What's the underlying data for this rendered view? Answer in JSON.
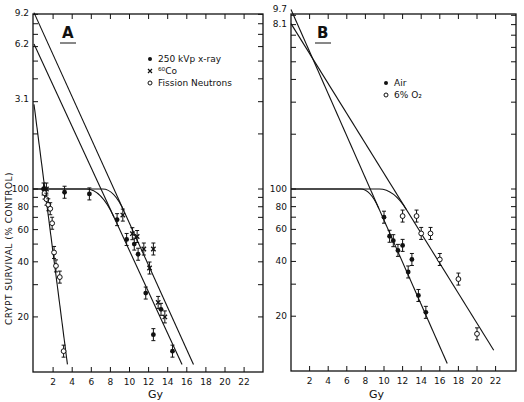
{
  "chart_data": [
    {
      "panel": "A",
      "type": "scatter",
      "title": "A",
      "xlabel": "Gy",
      "ylabel": "CRYPT SURVIVAL (% CONTROL)",
      "yscale": "log",
      "xlim": [
        0,
        24
      ],
      "ylim": [
        10,
        1000
      ],
      "x_ticks": [
        2,
        4,
        6,
        8,
        10,
        12,
        14,
        16,
        18,
        20,
        22
      ],
      "y_ticks": [
        {
          "value": 20,
          "label": "20"
        },
        {
          "value": 40,
          "label": "40"
        },
        {
          "value": 60,
          "label": "60"
        },
        {
          "value": 80,
          "label": "80"
        },
        {
          "value": 100,
          "label": "100"
        }
      ],
      "extrapolation_labels": [
        {
          "value": 310,
          "label": "3.1"
        },
        {
          "value": 620,
          "label": "6.2"
        },
        {
          "value": 920,
          "label": "9.2"
        }
      ],
      "legend": [
        {
          "marker": "filled-circle",
          "label": "250 kVp x-ray"
        },
        {
          "marker": "cross",
          "label": "⁶⁰Co"
        },
        {
          "marker": "open-circle",
          "label": "Fission Neutrons"
        }
      ],
      "legend_position": "top-right",
      "series": [
        {
          "name": "250 kVp x-ray",
          "marker": "filled-circle",
          "points": [
            [
              1.0,
              100
            ],
            [
              3.2,
              96
            ],
            [
              5.8,
              94
            ],
            [
              8.7,
              68
            ],
            [
              9.7,
              53
            ],
            [
              10.5,
              50
            ],
            [
              10.9,
              44
            ],
            [
              11.7,
              27
            ],
            [
              12.5,
              16
            ],
            [
              13.3,
              22
            ],
            [
              14.5,
              13
            ]
          ]
        },
        {
          "name": "⁶⁰Co",
          "marker": "cross",
          "points": [
            [
              1.3,
              100
            ],
            [
              9.3,
              72
            ],
            [
              10.3,
              57
            ],
            [
              10.8,
              55
            ],
            [
              11.5,
              47
            ],
            [
              12.1,
              37
            ],
            [
              12.5,
              47
            ],
            [
              13.0,
              24
            ],
            [
              13.7,
              20
            ]
          ]
        },
        {
          "name": "Fission Neutrons",
          "marker": "open-circle",
          "points": [
            [
              1.1,
              95
            ],
            [
              1.3,
              88
            ],
            [
              1.5,
              82
            ],
            [
              1.7,
              78
            ],
            [
              1.9,
              65
            ],
            [
              2.1,
              45
            ],
            [
              2.3,
              38
            ],
            [
              2.7,
              33
            ],
            [
              3.1,
              13
            ]
          ]
        }
      ],
      "fits": [
        {
          "name": "Fission Neutrons fit",
          "x0": 0,
          "y0": 290,
          "x1": 3.5,
          "y1": 11
        },
        {
          "name": "60Co extrapolation",
          "x0": 0,
          "y0": 920,
          "x1": 16.7,
          "y1": 11
        },
        {
          "name": "x-ray extrapolation",
          "x0": 0,
          "y0": 620,
          "x1": 15.5,
          "y1": 11
        },
        {
          "name": "60Co shoulder",
          "shoulder_end": 7.2
        },
        {
          "name": "x-ray shoulder",
          "shoulder_end": 5.5
        }
      ]
    },
    {
      "panel": "B",
      "type": "scatter",
      "title": "B",
      "xlabel": "Gy",
      "ylabel": "",
      "yscale": "log",
      "xlim": [
        0,
        24
      ],
      "ylim": [
        10,
        1000
      ],
      "x_ticks": [
        2,
        4,
        6,
        8,
        10,
        12,
        14,
        16,
        18,
        20,
        22
      ],
      "y_ticks": [
        {
          "value": 20,
          "label": "20"
        },
        {
          "value": 40,
          "label": "40"
        },
        {
          "value": 60,
          "label": "60"
        },
        {
          "value": 80,
          "label": "80"
        },
        {
          "value": 100,
          "label": "100"
        }
      ],
      "extrapolation_labels": [
        {
          "value": 810,
          "label": "8.1"
        },
        {
          "value": 970,
          "label": "9.7"
        }
      ],
      "legend": [
        {
          "marker": "filled-circle",
          "label": "Air"
        },
        {
          "marker": "open-circle",
          "label": "6% O₂"
        }
      ],
      "legend_position": "top-right",
      "series": [
        {
          "name": "Air",
          "marker": "filled-circle",
          "points": [
            [
              10.0,
              70
            ],
            [
              10.6,
              55
            ],
            [
              11.0,
              52
            ],
            [
              11.5,
              46
            ],
            [
              12.0,
              49
            ],
            [
              13.0,
              41
            ],
            [
              12.6,
              35
            ],
            [
              13.7,
              26
            ],
            [
              14.5,
              21
            ]
          ]
        },
        {
          "name": "6% O₂",
          "marker": "open-circle",
          "points": [
            [
              12.0,
              71
            ],
            [
              13.5,
              71
            ],
            [
              14.0,
              57
            ],
            [
              15.0,
              57
            ],
            [
              16.0,
              41
            ],
            [
              18.0,
              32
            ],
            [
              20.0,
              16
            ]
          ]
        }
      ],
      "fits": [
        {
          "name": "Air extrapolation",
          "x0": 0,
          "y0": 970,
          "x1": 16.8,
          "y1": 11
        },
        {
          "name": "6% O2 extrapolation",
          "x0": 0,
          "y0": 810,
          "x1": 21.8,
          "y1": 13
        },
        {
          "name": "Air shoulder",
          "shoulder_end": 7.5
        },
        {
          "name": "6% O2 shoulder",
          "shoulder_end": 9.5
        }
      ]
    }
  ]
}
